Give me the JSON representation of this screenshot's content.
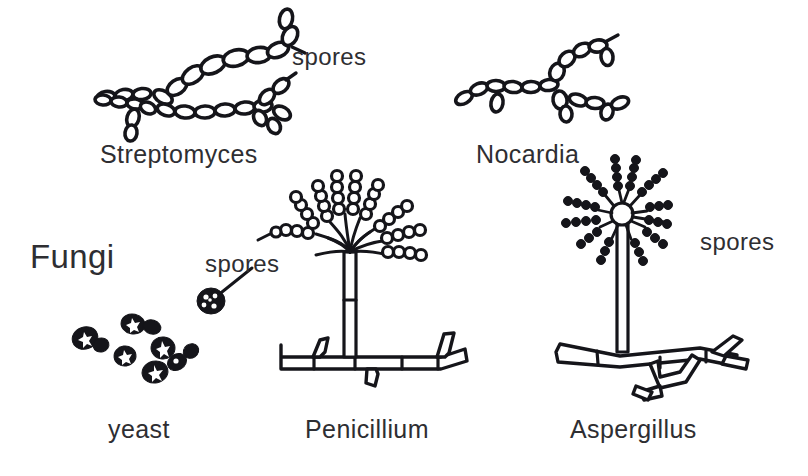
{
  "figure": {
    "background_color": "#ffffff",
    "ink_color": "#15151a",
    "text_color": "#2e2e32"
  },
  "group_labels": [
    {
      "id": "fungi",
      "text": "Fungi",
      "x": 30,
      "y": 268
    }
  ],
  "organisms": [
    {
      "id": "streptomyces",
      "label": "Streptomyces",
      "x": 100,
      "y": 163,
      "group": "actinomycete"
    },
    {
      "id": "nocardia",
      "label": "Nocardia",
      "x": 476,
      "y": 163,
      "group": "actinomycete"
    },
    {
      "id": "yeast",
      "label": "yeast",
      "x": 108,
      "y": 438,
      "group": "fungi"
    },
    {
      "id": "penicillium",
      "label": "Penicillium",
      "x": 305,
      "y": 438,
      "group": "fungi"
    },
    {
      "id": "aspergillus",
      "label": "Aspergillus",
      "x": 570,
      "y": 438,
      "group": "fungi"
    }
  ],
  "annotations": [
    {
      "id": "spores-streptomyces",
      "text": "spores",
      "x": 292,
      "y": 65,
      "target": "streptomyces"
    },
    {
      "id": "spores-yeast",
      "text": "spores",
      "x": 205,
      "y": 272,
      "target": "yeast"
    },
    {
      "id": "spores-aspergillus",
      "text": "spores",
      "x": 700,
      "y": 250,
      "target": "aspergillus"
    }
  ]
}
